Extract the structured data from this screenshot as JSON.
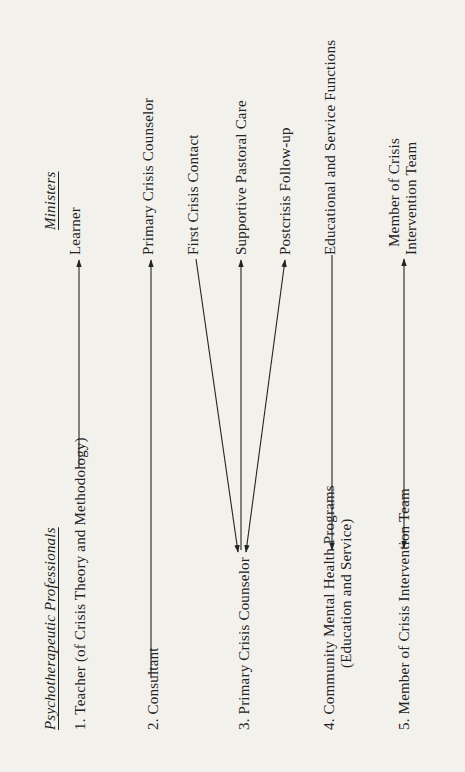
{
  "left_column": {
    "header": "Psychotherapeutic Professionals",
    "items": [
      {
        "label": "1.  Teacher (of Crisis Theory and Methodology)"
      },
      {
        "label": "2.  Consultant"
      },
      {
        "label": "3.  Primary Crisis Counselor"
      },
      {
        "label": "4.  Community Mental Health Programs",
        "label2": "(Education and Service)"
      },
      {
        "label": "5.  Member of Crisis Intervention Team"
      }
    ]
  },
  "right_column": {
    "header": "Ministers",
    "items": [
      {
        "label": "Learner"
      },
      {
        "label": "Primary Crisis Counselor"
      },
      {
        "label": "First Crisis Contact"
      },
      {
        "label": "Supportive Pastoral Care"
      },
      {
        "label": "Postcrisis Follow-up"
      },
      {
        "label": "Educational and Service Functions"
      },
      {
        "label": "Member of Crisis",
        "label2": "Intervention Team"
      }
    ]
  },
  "connections": [
    {
      "from": "Teacher (of Crisis Theory and Methodology)",
      "to": "Learner",
      "direction": "to-minister"
    },
    {
      "from": "Consultant",
      "to": "Primary Crisis Counselor",
      "direction": "to-minister"
    },
    {
      "from": "First Crisis Contact",
      "to": "Primary Crisis Counselor (professional)",
      "direction": "to-professional"
    },
    {
      "from": "Primary Crisis Counselor (professional)",
      "to": "Supportive Pastoral Care",
      "direction": "bidirectional"
    },
    {
      "from": "Primary Crisis Counselor (professional)",
      "to": "Postcrisis Follow-up",
      "direction": "bidirectional"
    },
    {
      "from": "Educational and Service Functions",
      "to": "Community Mental Health Programs",
      "direction": "to-professional"
    },
    {
      "from": "Member of Crisis Intervention Team",
      "to": "Member of Crisis Intervention Team",
      "direction": "bidirectional"
    }
  ]
}
